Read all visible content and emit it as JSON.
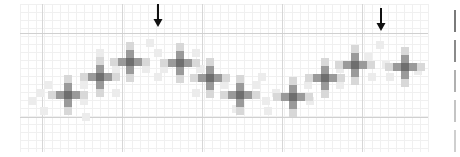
{
  "figure": {
    "colors": {
      "background": "#ffffff",
      "minor_grid": "#f0f0f0",
      "major_grid": "#d0d0d0",
      "arrow": "#111111",
      "shade_levels": [
        "#6e6e6e",
        "#9a9a9a",
        "#bdbdbd",
        "#d8d8d8",
        "#ececec"
      ]
    },
    "grid": {
      "origin_x": 20,
      "origin_y": 4,
      "width": 408,
      "height": 148,
      "cell": 8,
      "major_x": [
        42,
        122,
        202,
        282,
        362
      ],
      "major_y": [
        33,
        117
      ]
    },
    "arrows": [
      {
        "name": "arrow-left",
        "x": 158,
        "y": 4
      },
      {
        "name": "arrow-right",
        "x": 381,
        "y": 8
      }
    ],
    "cross_centers": [
      {
        "x": 68,
        "y": 95
      },
      {
        "x": 100,
        "y": 77
      },
      {
        "x": 130,
        "y": 62
      },
      {
        "x": 180,
        "y": 63
      },
      {
        "x": 210,
        "y": 78
      },
      {
        "x": 240,
        "y": 95
      },
      {
        "x": 293,
        "y": 97
      },
      {
        "x": 325,
        "y": 78
      },
      {
        "x": 355,
        "y": 65
      },
      {
        "x": 405,
        "y": 67
      }
    ],
    "light_cells": [
      {
        "x": 40,
        "y": 93
      },
      {
        "x": 32,
        "y": 101
      },
      {
        "x": 48,
        "y": 85
      },
      {
        "x": 44,
        "y": 111
      },
      {
        "x": 84,
        "y": 101
      },
      {
        "x": 84,
        "y": 85
      },
      {
        "x": 116,
        "y": 69
      },
      {
        "x": 116,
        "y": 93
      },
      {
        "x": 86,
        "y": 117
      },
      {
        "x": 100,
        "y": 53
      },
      {
        "x": 146,
        "y": 69
      },
      {
        "x": 150,
        "y": 43
      },
      {
        "x": 158,
        "y": 53
      },
      {
        "x": 164,
        "y": 69
      },
      {
        "x": 158,
        "y": 77
      },
      {
        "x": 196,
        "y": 53
      },
      {
        "x": 200,
        "y": 69
      },
      {
        "x": 196,
        "y": 93
      },
      {
        "x": 224,
        "y": 85
      },
      {
        "x": 256,
        "y": 85
      },
      {
        "x": 266,
        "y": 101
      },
      {
        "x": 262,
        "y": 77
      },
      {
        "x": 276,
        "y": 93
      },
      {
        "x": 308,
        "y": 85
      },
      {
        "x": 310,
        "y": 101
      },
      {
        "x": 236,
        "y": 109
      },
      {
        "x": 268,
        "y": 111
      },
      {
        "x": 340,
        "y": 69
      },
      {
        "x": 340,
        "y": 85
      },
      {
        "x": 368,
        "y": 57
      },
      {
        "x": 380,
        "y": 45
      },
      {
        "x": 386,
        "y": 65
      },
      {
        "x": 372,
        "y": 77
      },
      {
        "x": 390,
        "y": 77
      },
      {
        "x": 418,
        "y": 71
      }
    ],
    "side_scale": [
      {
        "y": 10,
        "h": 22,
        "shade": "#7a7a7a"
      },
      {
        "y": 40,
        "h": 22,
        "shade": "#8a8a8a"
      },
      {
        "y": 70,
        "h": 22,
        "shade": "#b0b0b0"
      },
      {
        "y": 100,
        "h": 22,
        "shade": "#c4c4c4"
      },
      {
        "y": 130,
        "h": 22,
        "shade": "#cfcfcf"
      }
    ]
  }
}
